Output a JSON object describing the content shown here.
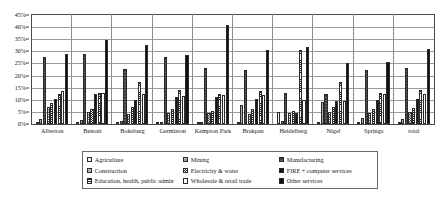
{
  "chart_data": {
    "type": "bar",
    "title": "",
    "xlabel": "",
    "ylabel": "",
    "ylim": [
      0,
      45
    ],
    "ytick_labels": [
      "0%",
      "5%",
      "10%",
      "15%",
      "20%",
      "25%",
      "30%",
      "35%",
      "40%",
      "45%"
    ],
    "ytick_values": [
      0,
      5,
      10,
      15,
      20,
      25,
      30,
      35,
      40,
      45
    ],
    "grid": true,
    "legend_position": "bottom",
    "categories": [
      "Alberton",
      "Benoni",
      "Boksburg",
      "Germiston",
      "Kempton Park",
      "Brakpan",
      "Heidelberg",
      "Nigel",
      "Springs",
      "total"
    ],
    "series": [
      {
        "name": "Agriculture",
        "pattern": "light-grid",
        "values": [
          0.6,
          0.6,
          0.5,
          0.4,
          0.5,
          0.8,
          5.0,
          1.0,
          0.6,
          0.6
        ]
      },
      {
        "name": "Mining",
        "pattern": "grey-solid",
        "values": [
          2.0,
          1.5,
          1.2,
          0.7,
          0.8,
          8.0,
          1.2,
          9.0,
          2.5,
          2.0
        ]
      },
      {
        "name": "Manufacturing",
        "pattern": "dark-grey",
        "values": [
          27.8,
          29.0,
          22.8,
          27.8,
          23.0,
          22.5,
          13.0,
          12.5,
          22.5,
          23.0
        ]
      },
      {
        "name": "Construction",
        "pattern": "checker",
        "values": [
          7.0,
          5.0,
          4.0,
          4.5,
          4.5,
          4.0,
          4.5,
          5.0,
          4.5,
          5.0
        ]
      },
      {
        "name": "Electricity & water",
        "pattern": "dense-checker",
        "values": [
          8.5,
          6.0,
          7.0,
          6.0,
          5.5,
          6.0,
          5.5,
          7.0,
          6.0,
          6.5
        ]
      },
      {
        "name": "FIRE + computer services",
        "pattern": "solid-black",
        "values": [
          10.5,
          12.5,
          10.0,
          11.0,
          11.0,
          10.5,
          4.5,
          9.5,
          10.0,
          10.5
        ]
      },
      {
        "name": "Education, health, public admin",
        "pattern": "h-stripes",
        "values": [
          12.5,
          13.0,
          17.5,
          14.0,
          12.5,
          13.5,
          30.5,
          17.5,
          13.0,
          14.0
        ]
      },
      {
        "name": "Wholesale & retail trade",
        "pattern": "white",
        "values": [
          13.5,
          13.0,
          12.5,
          11.5,
          12.0,
          12.0,
          10.0,
          9.5,
          12.5,
          12.5
        ]
      },
      {
        "name": "Other services",
        "pattern": "solid-black-2",
        "values": [
          29.0,
          34.5,
          32.5,
          28.5,
          41.0,
          30.5,
          32.0,
          25.0,
          25.5,
          31.0
        ]
      }
    ]
  },
  "legend": {
    "items": [
      {
        "label": "Agriculture"
      },
      {
        "label": "Mining"
      },
      {
        "label": "Manufacturing"
      },
      {
        "label": "Construction"
      },
      {
        "label": "Electricity & water"
      },
      {
        "label": "FIRE + computer services"
      },
      {
        "label": "Education, health, public admin"
      },
      {
        "label": "Wholesale & retail trade"
      },
      {
        "label": "Other services"
      }
    ]
  }
}
